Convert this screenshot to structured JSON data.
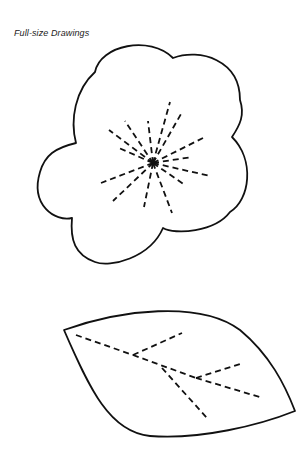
{
  "page": {
    "caption": "Full-size Drawings"
  },
  "figures": [
    {
      "name": "flower",
      "description": "Five-petal flower outline with dashed stamen lines radiating from center"
    },
    {
      "name": "leaf",
      "description": "Leaf outline with dashed vein lines"
    }
  ],
  "colors": {
    "line": "#111111",
    "background": "#ffffff"
  }
}
